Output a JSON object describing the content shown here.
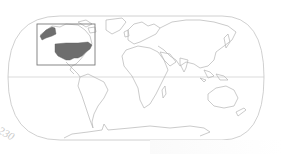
{
  "map": {
    "type": "locator-map",
    "projection": "robinson-like",
    "highlighted_region": "United States",
    "locator_box": {
      "x": 37,
      "y": 24,
      "width": 58,
      "height": 41
    },
    "equator_y": 77,
    "colors": {
      "background": "#ffffff",
      "coastline": "#b4b4b4",
      "graticule": "#c4c4c4",
      "highlight_fill": "#6e6e6e",
      "locator_box": "#7a7a7a"
    }
  },
  "page": {
    "number": "230"
  }
}
